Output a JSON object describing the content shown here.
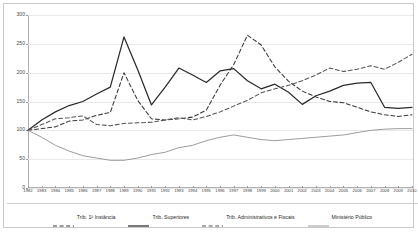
{
  "chart_data": {
    "type": "line",
    "title": "",
    "xlabel": "",
    "ylabel": "",
    "ylim": [
      0,
      300
    ],
    "yticks": [
      0,
      50,
      100,
      150,
      200,
      250,
      300
    ],
    "grid": true,
    "legend_position": "bottom",
    "categories": [
      "1982",
      "1983",
      "1984",
      "1985",
      "1986",
      "1987",
      "1988",
      "1989",
      "1990",
      "1991",
      "1992",
      "1993",
      "1994",
      "1995",
      "1996",
      "1997",
      "1998",
      "1999",
      "2000",
      "2001",
      "2002",
      "2003",
      "2004",
      "2005",
      "2006",
      "2007",
      "2008",
      "2009",
      "2010"
    ],
    "series": [
      {
        "name": "Trib. 1ª Instância",
        "style": "dashed",
        "color": "#3a3a3a",
        "values": [
          100,
          103,
          106,
          116,
          118,
          126,
          131,
          200,
          152,
          120,
          118,
          120,
          123,
          135,
          178,
          214,
          265,
          248,
          210,
          185,
          168,
          158,
          150,
          148,
          140,
          132,
          127,
          124,
          127
        ]
      },
      {
        "name": "Trib. Superiores",
        "style": "solid",
        "color": "#2b2b2b",
        "values": [
          100,
          118,
          132,
          143,
          150,
          163,
          175,
          262,
          205,
          144,
          175,
          208,
          196,
          183,
          203,
          207,
          186,
          172,
          180,
          166,
          145,
          160,
          168,
          178,
          182,
          183,
          140,
          138,
          140
        ]
      },
      {
        "name": "Trib. Administrativos e Fiscais",
        "style": "dashed",
        "color": "#555555",
        "values": [
          100,
          110,
          120,
          122,
          125,
          110,
          108,
          112,
          113,
          114,
          118,
          122,
          118,
          124,
          132,
          142,
          152,
          165,
          172,
          178,
          186,
          196,
          208,
          202,
          206,
          212,
          206,
          218,
          232
        ]
      },
      {
        "name": "Ministério Público",
        "style": "solid-thin",
        "color": "#8a8a8a",
        "values": [
          100,
          88,
          74,
          64,
          56,
          52,
          48,
          48,
          52,
          58,
          62,
          70,
          74,
          82,
          88,
          92,
          88,
          84,
          82,
          84,
          86,
          88,
          90,
          92,
          96,
          100,
          102,
          103,
          103
        ]
      }
    ]
  },
  "legend": {
    "items": [
      {
        "label": "Trib. 1ª Instância",
        "style": "dashed",
        "color": "#3a3a3a"
      },
      {
        "label": "Trib. Superiores",
        "style": "solid",
        "color": "#2b2b2b"
      },
      {
        "label": "Trib. Administrativos e Fiscais",
        "style": "dashed",
        "color": "#555555"
      },
      {
        "label": "Ministério Público",
        "style": "solid-thin",
        "color": "#8a8a8a"
      }
    ]
  }
}
